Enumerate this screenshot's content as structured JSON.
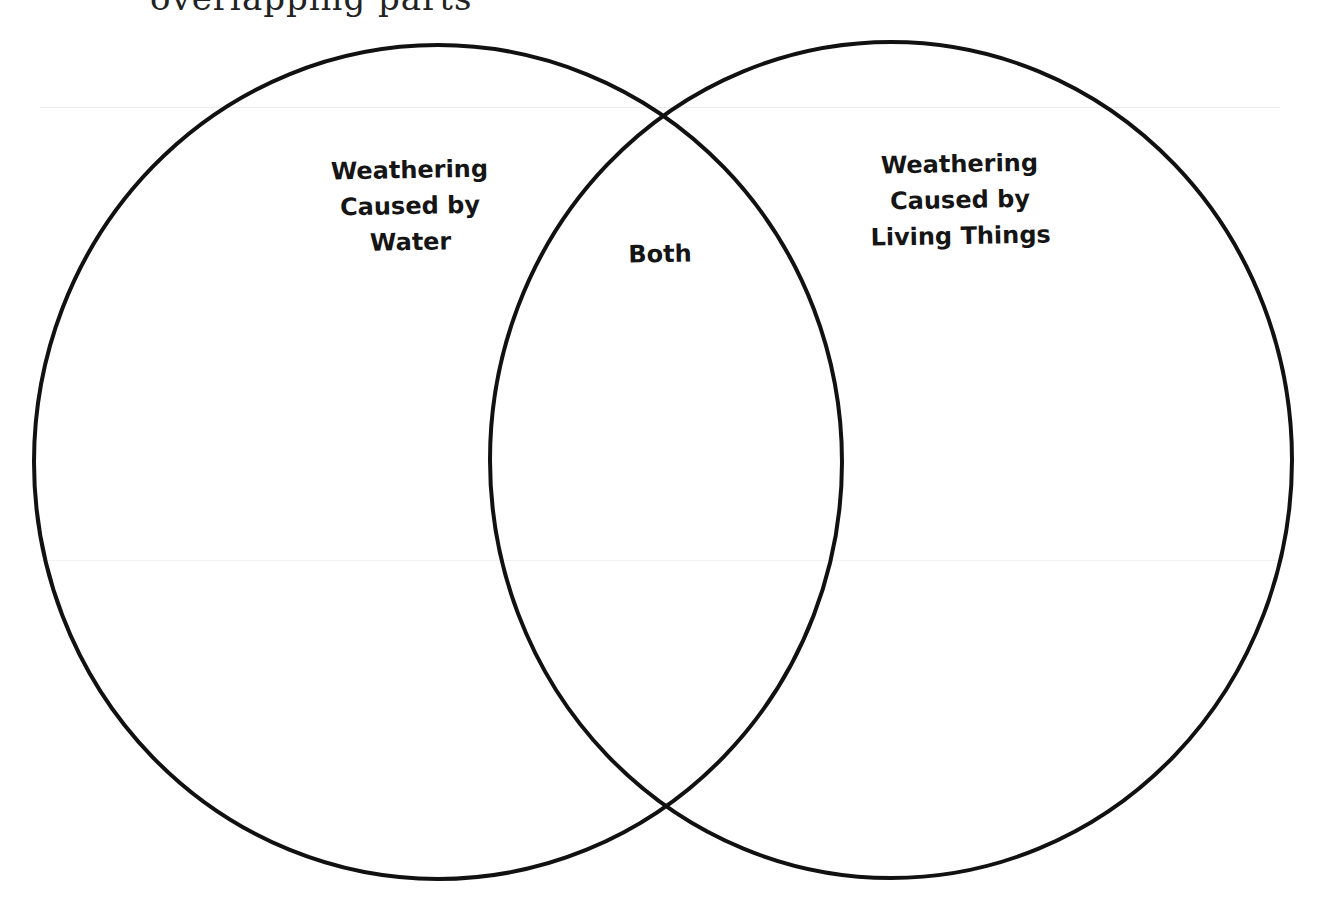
{
  "page": {
    "clipped_heading_text": "overlapping parts"
  },
  "diagram": {
    "type": "venn",
    "stroke_color": "#111111",
    "background": "#ffffff",
    "sets": [
      {
        "id": "left",
        "label_lines": [
          "Weathering",
          "Caused by",
          "Water"
        ],
        "label": "Weathering Caused by Water"
      },
      {
        "id": "right",
        "label_lines": [
          "Weathering",
          "Caused by",
          "Living Things"
        ],
        "label": "Weathering Caused by Living Things"
      }
    ],
    "intersection": {
      "label": "Both"
    }
  }
}
